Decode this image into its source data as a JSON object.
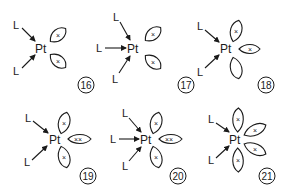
{
  "diagram": {
    "figures": [
      {
        "number": "16",
        "center": "Pt",
        "ligands": [
          "L",
          "L"
        ],
        "lobes": [
          {
            "position": "upper-right",
            "electrons": "×"
          },
          {
            "position": "lower-right",
            "electrons": "×"
          }
        ]
      },
      {
        "number": "17",
        "center": "Pt",
        "ligands": [
          "L",
          "L",
          "L"
        ],
        "lobes": [
          {
            "position": "upper-right",
            "electrons": "×"
          },
          {
            "position": "lower-right",
            "electrons": "×"
          }
        ]
      },
      {
        "number": "18",
        "center": "Pt",
        "ligands": [
          "L",
          "L"
        ],
        "lobes": [
          {
            "position": "top",
            "electrons": "×"
          },
          {
            "position": "right",
            "electrons": "×"
          },
          {
            "position": "bottom",
            "electrons": ""
          }
        ]
      },
      {
        "number": "19",
        "center": "Pt",
        "ligands": [
          "L",
          "L"
        ],
        "lobes": [
          {
            "position": "top",
            "electrons": "×"
          },
          {
            "position": "right",
            "electrons": "××"
          },
          {
            "position": "bottom",
            "electrons": "×"
          }
        ]
      },
      {
        "number": "20",
        "center": "Pt",
        "ligands": [
          "L",
          "L",
          "L"
        ],
        "lobes": [
          {
            "position": "top",
            "electrons": "×"
          },
          {
            "position": "right",
            "electrons": "××"
          },
          {
            "position": "bottom",
            "electrons": "×"
          }
        ]
      },
      {
        "number": "21",
        "center": "Pt",
        "ligands": [
          "L",
          "L"
        ],
        "lobes": [
          {
            "position": "top",
            "electrons": "×"
          },
          {
            "position": "upper-right",
            "electrons": "×"
          },
          {
            "position": "lower-right",
            "electrons": "×"
          },
          {
            "position": "bottom",
            "electrons": "×"
          }
        ]
      }
    ]
  }
}
